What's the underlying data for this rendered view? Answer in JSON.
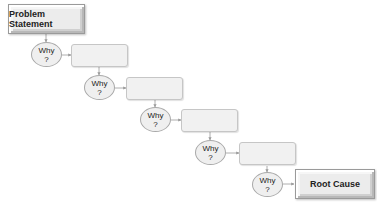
{
  "diagram": {
    "start": {
      "label": "Problem Statement"
    },
    "end": {
      "label": "Root Cause"
    },
    "whys": [
      {
        "line1": "Why",
        "line2": "?",
        "answer": ""
      },
      {
        "line1": "Why",
        "line2": "?",
        "answer": ""
      },
      {
        "line1": "Why",
        "line2": "?",
        "answer": ""
      },
      {
        "line1": "Why",
        "line2": "?",
        "answer": ""
      },
      {
        "line1": "Why",
        "line2": "?",
        "answer": ""
      }
    ],
    "colors": {
      "box_fill": "#ececec",
      "oval_fill": "#efefef",
      "border": "#a8a8a8",
      "connector": "#9a9a9a",
      "text": "#222222"
    }
  }
}
